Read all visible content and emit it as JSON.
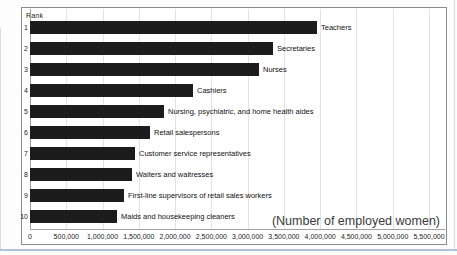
{
  "chart_data": {
    "type": "bar",
    "orientation": "horizontal",
    "rank_header": "Rank",
    "annotation": "(Number of employed women)",
    "ranks": [
      "1",
      "2",
      "3",
      "4",
      "5",
      "6",
      "7",
      "8",
      "9",
      "10"
    ],
    "categories": [
      "Teachers",
      "Secretaries",
      "Nurses",
      "Cashiers",
      "Nursing, psychiatric, and home health aides",
      "Retail salespersons",
      "Customer service representatives",
      "Waiters and waitresses",
      "First-line supervisors of retail sales workers",
      "Maids and housekeeping cleaners"
    ],
    "values": [
      3950000,
      3350000,
      3150000,
      2250000,
      1850000,
      1650000,
      1450000,
      1400000,
      1300000,
      1200000
    ],
    "x_axis": {
      "min": 0,
      "max": 5500000,
      "tick_interval": 500000,
      "tick_labels": [
        "0",
        "500,000",
        "1,000,000",
        "1,500,000",
        "2,000,000",
        "2,500,000",
        "3,000,000",
        "3,500,000",
        "4,000,000",
        "4,500,000",
        "5,000,000",
        "5,500,000"
      ]
    },
    "grid": true,
    "legend": "none",
    "bar_color": "#1c1c1c"
  },
  "colors": {
    "bar": "#1c1c1c",
    "chart_border": "#8c8c8c",
    "gridline": "#e2e2e2",
    "axis_line": "#a0a0a0",
    "text": "#1a1a1a",
    "annotation_text": "#3a3a3a",
    "bottom_rule": "#b3c2da",
    "page_edge": "#dadada"
  }
}
